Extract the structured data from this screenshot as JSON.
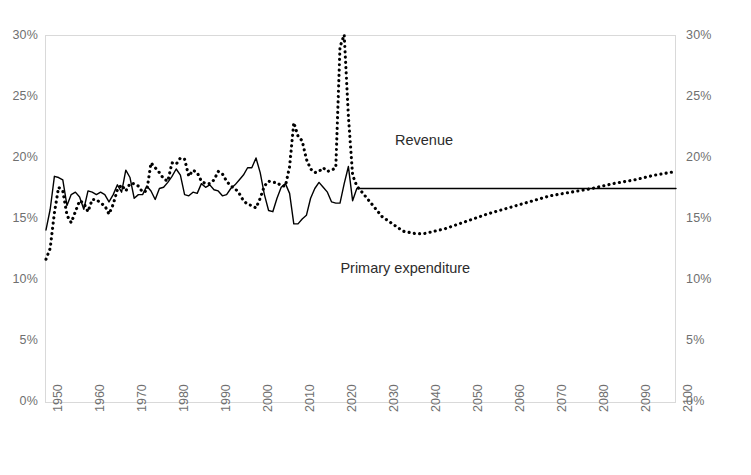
{
  "chart_data": {
    "type": "line",
    "title": "",
    "subtitle": "",
    "xlabel": "",
    "ylabel": "",
    "xlim": [
      1950,
      2100
    ],
    "ylim": [
      0,
      30
    ],
    "grid": false,
    "legend_position": "inline-annotation",
    "y_tick_labels": [
      "0%",
      "5%",
      "10%",
      "15%",
      "20%",
      "25%",
      "30%"
    ],
    "y_ticks": [
      0,
      5,
      10,
      15,
      20,
      25,
      30
    ],
    "y_axis_left_labels": [
      "30%",
      "25%",
      "20%",
      "15%",
      "10%",
      "5%",
      "0%"
    ],
    "y_axis_right_labels": [
      "30%",
      "25%",
      "20%",
      "15%",
      "10%",
      "5%",
      "0%"
    ],
    "x_tick_labels": [
      "1950",
      "1960",
      "1970",
      "1980",
      "1990",
      "2000",
      "2010",
      "2020",
      "2030",
      "2040",
      "2050",
      "2060",
      "2070",
      "2080",
      "2090",
      "2100"
    ],
    "x_ticks": [
      1950,
      1960,
      1970,
      1980,
      1990,
      2000,
      2010,
      2020,
      2030,
      2040,
      2050,
      2060,
      2070,
      2080,
      2090,
      2100
    ],
    "annotations": [
      {
        "text": "Revenue",
        "x": 2045,
        "y": 21.3
      },
      {
        "text": "Primary expenditure",
        "x": 2032,
        "y": 10.8
      }
    ],
    "series": [
      {
        "name": "Revenue",
        "style": "solid",
        "color": "#000000",
        "x": [
          1950,
          1951,
          1952,
          1953,
          1954,
          1955,
          1956,
          1957,
          1958,
          1959,
          1960,
          1961,
          1962,
          1963,
          1964,
          1965,
          1966,
          1967,
          1968,
          1969,
          1970,
          1971,
          1972,
          1973,
          1974,
          1975,
          1976,
          1977,
          1978,
          1979,
          1980,
          1981,
          1982,
          1983,
          1984,
          1985,
          1986,
          1987,
          1988,
          1989,
          1990,
          1991,
          1992,
          1993,
          1994,
          1995,
          1996,
          1997,
          1998,
          1999,
          2000,
          2001,
          2002,
          2003,
          2004,
          2005,
          2006,
          2007,
          2008,
          2009,
          2010,
          2011,
          2012,
          2013,
          2014,
          2015,
          2016,
          2017,
          2018,
          2019,
          2020,
          2021,
          2022,
          2023,
          2024,
          2030,
          2040,
          2050,
          2060,
          2070,
          2080,
          2090,
          2100
        ],
        "y": [
          14.1,
          15.8,
          18.5,
          18.4,
          18.2,
          16.1,
          17.0,
          17.2,
          16.8,
          15.8,
          17.3,
          17.2,
          17.0,
          17.2,
          17.0,
          16.4,
          17.0,
          17.8,
          17.2,
          19.0,
          18.4,
          16.7,
          17.0,
          17.0,
          17.7,
          17.3,
          16.6,
          17.5,
          17.6,
          18.0,
          18.5,
          19.1,
          18.6,
          17.0,
          16.9,
          17.2,
          17.1,
          17.9,
          17.6,
          17.8,
          17.4,
          17.3,
          16.9,
          17.0,
          17.5,
          17.8,
          18.2,
          18.6,
          19.2,
          19.2,
          20.0,
          18.8,
          17.0,
          15.7,
          15.6,
          16.7,
          17.6,
          17.9,
          17.1,
          14.6,
          14.6,
          15.0,
          15.3,
          16.7,
          17.5,
          18.0,
          17.6,
          17.2,
          16.4,
          16.3,
          16.3,
          17.9,
          19.3,
          16.5,
          17.5,
          17.5,
          17.5,
          17.5,
          17.5,
          17.5,
          17.5,
          17.5,
          17.5
        ]
      },
      {
        "name": "Primary expenditure",
        "style": "dotted",
        "color": "#000000",
        "x": [
          1950,
          1951,
          1952,
          1953,
          1954,
          1955,
          1956,
          1957,
          1958,
          1959,
          1960,
          1961,
          1962,
          1963,
          1964,
          1965,
          1966,
          1967,
          1968,
          1969,
          1970,
          1971,
          1972,
          1973,
          1974,
          1975,
          1976,
          1977,
          1978,
          1979,
          1980,
          1981,
          1982,
          1983,
          1984,
          1985,
          1986,
          1987,
          1988,
          1989,
          1990,
          1991,
          1992,
          1993,
          1994,
          1995,
          1996,
          1997,
          1998,
          1999,
          2000,
          2001,
          2002,
          2003,
          2004,
          2005,
          2006,
          2007,
          2008,
          2009,
          2010,
          2011,
          2012,
          2013,
          2014,
          2015,
          2016,
          2017,
          2018,
          2019,
          2020,
          2021,
          2022,
          2023,
          2024,
          2025,
          2030,
          2035,
          2038,
          2040,
          2045,
          2050,
          2055,
          2060,
          2065,
          2070,
          2075,
          2080,
          2085,
          2090,
          2095,
          2100
        ],
        "y": [
          11.7,
          12.6,
          15.5,
          17.6,
          17.3,
          15.3,
          14.7,
          15.6,
          16.5,
          16.3,
          15.6,
          16.6,
          16.6,
          16.3,
          16.1,
          15.4,
          16.2,
          17.4,
          17.8,
          17.3,
          17.9,
          17.9,
          17.7,
          17.2,
          17.3,
          19.6,
          19.2,
          18.8,
          18.3,
          18.1,
          19.6,
          19.5,
          20.0,
          19.9,
          18.5,
          19.0,
          18.8,
          18.1,
          17.9,
          17.9,
          18.2,
          18.9,
          18.7,
          18.1,
          17.7,
          17.5,
          17.1,
          16.5,
          16.2,
          16.1,
          15.9,
          16.7,
          17.7,
          18.1,
          18.0,
          18.0,
          17.7,
          17.7,
          19.3,
          22.9,
          21.8,
          21.4,
          19.9,
          19.1,
          18.8,
          18.9,
          19.2,
          18.9,
          19.0,
          19.2,
          29.1,
          30.1,
          23.4,
          18.6,
          17.7,
          17.3,
          15.2,
          14.0,
          13.8,
          13.8,
          14.2,
          14.8,
          15.4,
          15.9,
          16.4,
          16.9,
          17.2,
          17.5,
          17.9,
          18.2,
          18.6,
          18.9
        ]
      }
    ]
  },
  "plot": {
    "border_color": "#d9d9d9",
    "background": "#ffffff",
    "axis_text_color": "#6f6f6f",
    "annotation_text_color": "#2c2c2c",
    "series_color": "#000000"
  }
}
